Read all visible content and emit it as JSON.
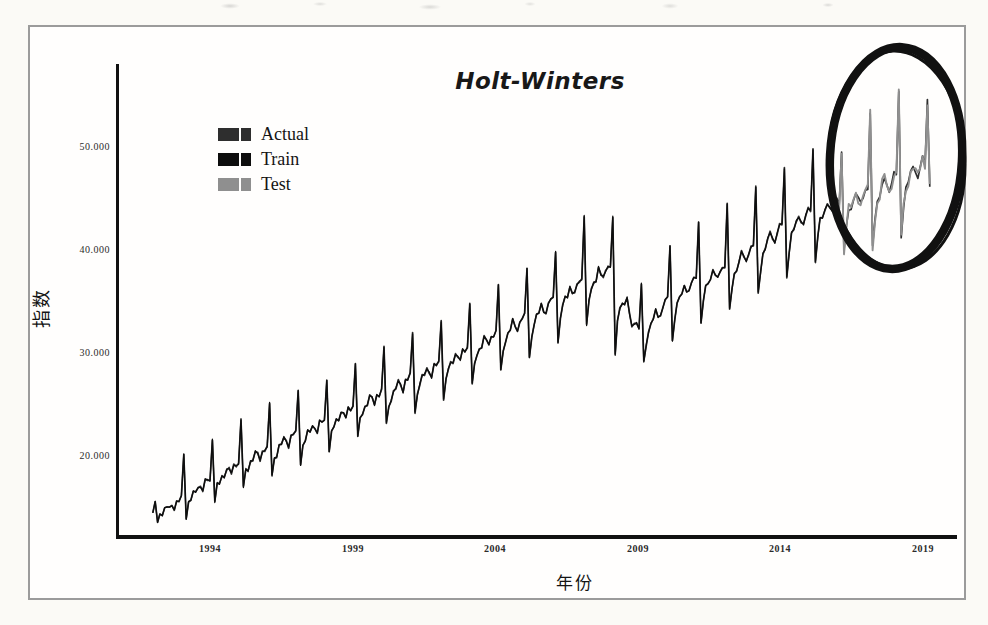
{
  "figure": {
    "title": "Holt-Winters",
    "x_axis_label": "年份",
    "y_axis_label": "指数"
  },
  "chart_data": {
    "type": "line",
    "title": "Holt-Winters",
    "xlabel": "年份",
    "ylabel": "指数",
    "x_tick_labels": [
      "1994",
      "1999",
      "2004",
      "2009",
      "2014",
      "2019"
    ],
    "x_tick_years": [
      1994,
      1999,
      2004,
      2009,
      2014,
      2019
    ],
    "y_tick_labels": [
      "50.000",
      "40.000",
      "30.000",
      "20.000"
    ],
    "y_tick_values": [
      50000,
      40000,
      30000,
      20000
    ],
    "x_range_years": [
      1992,
      2019.25
    ],
    "y_range": [
      12000,
      58000
    ],
    "grid": false,
    "frequency": "monthly",
    "seasonality_note": "annual spike (around Feb) followed by a sharp trough, rising long-term trend",
    "legend": {
      "position": "upper-left",
      "entries": [
        {
          "label": "Actual",
          "color": "#2e2e2e"
        },
        {
          "label": "Train",
          "color": "#0d0d0d"
        },
        {
          "label": "Test",
          "color": "#8f8f8f"
        }
      ]
    },
    "series_split": {
      "train_period": "1992-2015",
      "test_period": "2016-2019",
      "actual_period": "1992-2019"
    },
    "annotation": {
      "shape": "hand-drawn-ellipse",
      "color": "#111111",
      "highlights": "test / forecast period 2016-2019"
    },
    "month_shape": {
      "pos": [
        0.12,
        1.0,
        0.0,
        0.0,
        0.0,
        0.02,
        0.06,
        0.14,
        0.08,
        0.02,
        0.1,
        0.15
      ],
      "neg": [
        0.0,
        0.0,
        1.0,
        0.4,
        0.15,
        0.05,
        0.0,
        0.0,
        0.0,
        0.1,
        0.0,
        0.0
      ]
    },
    "years": [
      {
        "year": 1992,
        "base": 14200,
        "peak": 15200,
        "dip": 13600
      },
      {
        "year": 1993,
        "base": 15500,
        "peak": 20000,
        "dip": 14000
      },
      {
        "year": 1994,
        "base": 17200,
        "peak": 21500,
        "dip": 15500
      },
      {
        "year": 1995,
        "base": 18800,
        "peak": 23300,
        "dip": 16800
      },
      {
        "year": 1996,
        "base": 20200,
        "peak": 24800,
        "dip": 18000
      },
      {
        "year": 1997,
        "base": 21600,
        "peak": 26300,
        "dip": 19200
      },
      {
        "year": 1998,
        "base": 22800,
        "peak": 27500,
        "dip": 20300
      },
      {
        "year": 1999,
        "base": 24200,
        "peak": 29000,
        "dip": 21500
      },
      {
        "year": 2000,
        "base": 25600,
        "peak": 30500,
        "dip": 22800
      },
      {
        "year": 2001,
        "base": 27000,
        "peak": 32000,
        "dip": 24000
      },
      {
        "year": 2002,
        "base": 28300,
        "peak": 33400,
        "dip": 25200
      },
      {
        "year": 2003,
        "base": 29800,
        "peak": 35000,
        "dip": 26500
      },
      {
        "year": 2004,
        "base": 31300,
        "peak": 36600,
        "dip": 27800
      },
      {
        "year": 2005,
        "base": 32800,
        "peak": 38200,
        "dip": 29200
      },
      {
        "year": 2006,
        "base": 34500,
        "peak": 40000,
        "dip": 30700
      },
      {
        "year": 2007,
        "base": 36300,
        "peak": 43500,
        "dip": 32300
      },
      {
        "year": 2008,
        "base": 37600,
        "peak": 43800,
        "dip": 30500
      },
      {
        "year": 2009,
        "base": 31500,
        "peak": 36500,
        "dip": 28500
      },
      {
        "year": 2010,
        "base": 34500,
        "peak": 40500,
        "dip": 30800
      },
      {
        "year": 2011,
        "base": 36500,
        "peak": 43000,
        "dip": 32500
      },
      {
        "year": 2012,
        "base": 37500,
        "peak": 44500,
        "dip": 33500
      },
      {
        "year": 2013,
        "base": 39500,
        "peak": 46000,
        "dip": 35200
      },
      {
        "year": 2014,
        "base": 41500,
        "peak": 48000,
        "dip": 37000
      },
      {
        "year": 2015,
        "base": 43000,
        "peak": 50000,
        "dip": 38500
      },
      {
        "year": 2016,
        "base": 44000,
        "peak": 49500,
        "dip": 39500
      },
      {
        "year": 2017,
        "base": 45000,
        "peak": 53000,
        "dip": 40000
      },
      {
        "year": 2018,
        "base": 46200,
        "peak": 55200,
        "dip": 41000
      },
      {
        "year": 2019,
        "base": 47500,
        "peak": 54600,
        "dip": 46000,
        "months": 3
      }
    ]
  }
}
